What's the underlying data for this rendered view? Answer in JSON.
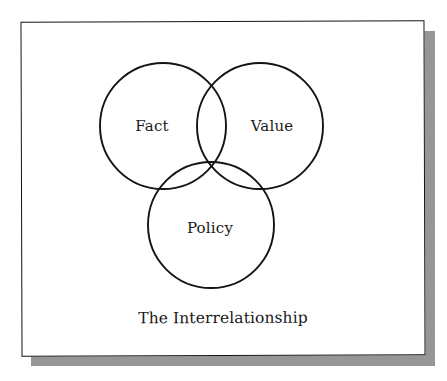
{
  "figure": {
    "caption": "The Interrelationship",
    "type": "venn-diagram",
    "frame": {
      "border_color": "#141414",
      "shadow_color": "#8d8d8d",
      "background_color": "#ffffff"
    },
    "stroke_color": "#141414",
    "circles": [
      {
        "id": "fact",
        "label": "Fact",
        "cx": 163,
        "cy": 126,
        "r": 63
      },
      {
        "id": "value",
        "label": "Value",
        "cx": 260,
        "cy": 126,
        "r": 63
      },
      {
        "id": "policy",
        "label": "Policy",
        "cx": 211,
        "cy": 225,
        "r": 63
      }
    ],
    "labels": [
      {
        "id": "fact",
        "text": "Fact",
        "x": 152,
        "y": 126
      },
      {
        "id": "value",
        "text": "Value",
        "x": 272,
        "y": 126
      },
      {
        "id": "policy",
        "text": "Policy",
        "x": 210,
        "y": 228
      }
    ]
  }
}
